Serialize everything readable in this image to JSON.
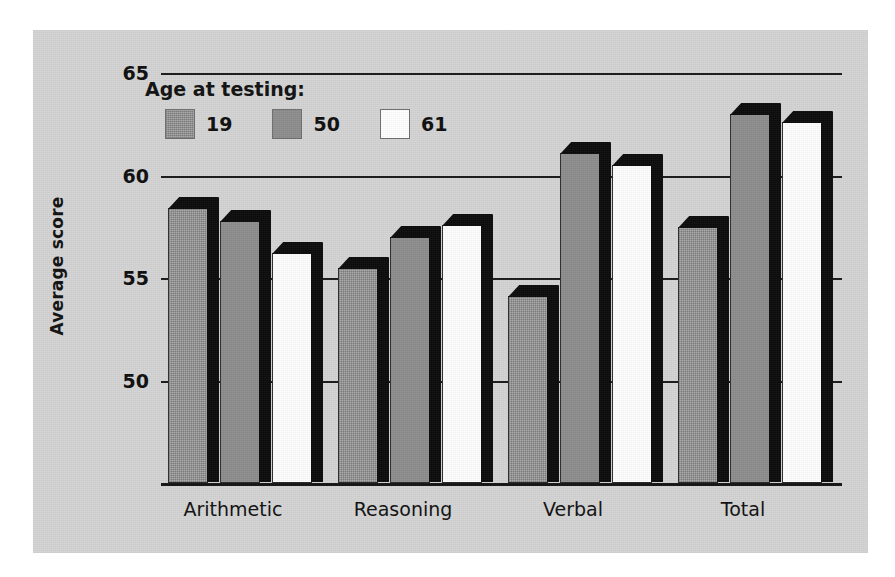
{
  "chart_data": {
    "type": "bar",
    "title": "",
    "xlabel": "",
    "ylabel": "Average score",
    "ylim": [
      45,
      65
    ],
    "yticks": [
      65,
      60,
      55,
      50
    ],
    "grid": true,
    "legend_title": "Age at testing:",
    "legend_position": "top-left inside plot",
    "categories": [
      "Arithmetic",
      "Reasoning",
      "Verbal",
      "Total"
    ],
    "series": [
      {
        "name": "19",
        "color": "#9a9a9a",
        "values": [
          58.4,
          55.5,
          54.1,
          57.5
        ]
      },
      {
        "name": "50",
        "color": "#8d8d8d",
        "values": [
          57.8,
          57.0,
          61.1,
          63.0
        ]
      },
      {
        "name": "61",
        "color": "#ffffff",
        "values": [
          56.2,
          57.6,
          60.5,
          62.6
        ]
      }
    ]
  },
  "figure": {
    "background": "#d4d4d4",
    "axis_color": "#141414",
    "shadow_color": "#0b0b0b"
  }
}
